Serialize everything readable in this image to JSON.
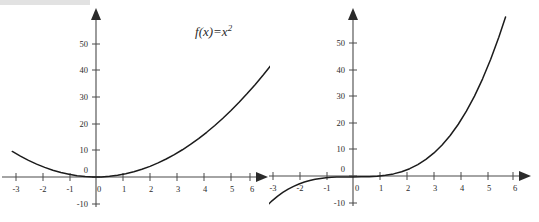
{
  "document": {
    "title": "Function and its integral — two plots",
    "background_color": "#ffffff",
    "curve_color": "#1c1c1c",
    "axis_color": "#4a4a4a",
    "top_bar_color": "#e2e2e2"
  },
  "labels": {
    "left_formula": {
      "fn_name": "f",
      "var": "(x)",
      "equals": "=",
      "body": "x",
      "exponent": "2",
      "plain": "f(x)=x²"
    },
    "right_formula": {
      "fn_name": "F",
      "var": "(x)",
      "equals": "=",
      "integral_sign": "∫",
      "lower_limit": "1",
      "upper_limit": "x",
      "integrand": "u",
      "integrand_exp": "2",
      "differential": "du",
      "equals2": "=",
      "term1_num": "x",
      "term1_num_exp": "3",
      "term1_den": "3",
      "minus": "−",
      "term2_num": "1",
      "term2_den": "3",
      "plain": "F(x) = ∫₁ˣ u²du = x³/3 − 1/3"
    }
  },
  "chart_data": [
    {
      "id": "plot-fx",
      "type": "line",
      "title": "f(x)=x²",
      "xlabel": "",
      "ylabel": "",
      "xlim": [
        -3.4,
        7.1
      ],
      "ylim": [
        -13,
        58
      ],
      "grid": false,
      "legend": "none",
      "x_ticks": [
        -3,
        -2,
        -1,
        0,
        1,
        2,
        3,
        4,
        5,
        6
      ],
      "x_tick_labels": [
        "-3",
        "-2",
        "-1",
        "0",
        "1",
        "2",
        "3",
        "4",
        "5",
        "6"
      ],
      "y_ticks": [
        -10,
        0,
        10,
        20,
        30,
        40,
        50
      ],
      "y_tick_labels": [
        "-10",
        "0",
        "10",
        "20",
        "30",
        "40",
        "50"
      ],
      "series": [
        {
          "name": "f(x)=x^2",
          "expression": "x^2",
          "x": [
            -3.1,
            -2.8,
            -2.5,
            -2.2,
            -1.9,
            -1.6,
            -1.3,
            -1.0,
            -0.7,
            -0.4,
            -0.1,
            0.2,
            0.5,
            0.8,
            1.1,
            1.4,
            1.7,
            2.0,
            2.3,
            2.6,
            2.9,
            3.2,
            3.5,
            3.8,
            4.1,
            4.4,
            4.7,
            5.0,
            5.3,
            5.6,
            5.9,
            6.2,
            6.5,
            6.9
          ],
          "values": [
            9.61,
            7.84,
            6.25,
            4.84,
            3.61,
            2.56,
            1.69,
            1.0,
            0.49,
            0.16,
            0.01,
            0.04,
            0.25,
            0.64,
            1.21,
            1.96,
            2.89,
            4.0,
            5.29,
            6.76,
            8.41,
            10.24,
            12.25,
            14.44,
            16.81,
            19.36,
            22.09,
            25.0,
            28.09,
            31.36,
            34.81,
            38.44,
            42.25,
            47.61
          ]
        }
      ]
    },
    {
      "id": "plot-Fx",
      "type": "line",
      "title": "F(x) = ∫₁ˣ u²du = x³/3 − 1/3",
      "xlabel": "",
      "ylabel": "",
      "xlim": [
        -3.4,
        7.1
      ],
      "ylim": [
        -13,
        58
      ],
      "grid": false,
      "legend": "none",
      "x_ticks": [
        -3,
        -2,
        -1,
        0,
        1,
        2,
        3,
        4,
        5,
        6
      ],
      "x_tick_labels": [
        "-3",
        "-2",
        "-1",
        "0",
        "1",
        "2",
        "3",
        "4",
        "5",
        "6"
      ],
      "y_ticks": [
        -10,
        0,
        10,
        20,
        30,
        40,
        50
      ],
      "y_tick_labels": [
        "-10",
        "0",
        "10",
        "20",
        "30",
        "40",
        "50"
      ],
      "series": [
        {
          "name": "F(x)=x^3/3-1/3",
          "expression": "x^3/3 - 1/3",
          "x": [
            -3.2,
            -3.0,
            -2.8,
            -2.6,
            -2.4,
            -2.2,
            -2.0,
            -1.8,
            -1.6,
            -1.4,
            -1.2,
            -1.0,
            -0.8,
            -0.6,
            -0.4,
            -0.2,
            0.0,
            0.3,
            0.6,
            0.9,
            1.2,
            1.5,
            1.8,
            2.1,
            2.4,
            2.7,
            3.0,
            3.3,
            3.6,
            3.9,
            4.2,
            4.5,
            4.8,
            5.1,
            5.4,
            5.65
          ],
          "values": [
            -11.26,
            -9.33,
            -7.65,
            -6.19,
            -4.94,
            -3.88,
            -3.0,
            -2.28,
            -1.7,
            -1.25,
            -0.91,
            -0.67,
            -0.5,
            -0.41,
            -0.35,
            -0.34,
            -0.33,
            -0.32,
            -0.26,
            -0.09,
            0.24,
            0.79,
            1.61,
            2.75,
            4.27,
            6.23,
            8.67,
            11.64,
            15.22,
            19.45,
            24.36,
            30.04,
            36.53,
            43.87,
            52.15,
            59.76
          ]
        }
      ]
    }
  ]
}
